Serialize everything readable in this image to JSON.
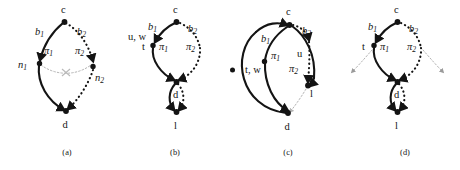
{
  "figure": {
    "background": "#ffffff",
    "ink": "#141414",
    "faint": "#b4b4b4",
    "width": 460,
    "height": 170
  },
  "panels": [
    {
      "id": "a",
      "caption": "(a)",
      "nodes": [
        {
          "name": "c",
          "label": "c"
        },
        {
          "name": "d",
          "label": "d"
        },
        {
          "name": "n1",
          "label": "n",
          "sub": "1"
        },
        {
          "name": "n2",
          "label": "n",
          "sub": "2"
        }
      ],
      "edges": [
        {
          "name": "b1",
          "label": "b",
          "sub": "1",
          "style": "solid"
        },
        {
          "name": "b2",
          "label": "b",
          "sub": "2",
          "style": "dotted"
        },
        {
          "name": "pi1",
          "label": "π",
          "sub": "1",
          "style": "solid"
        },
        {
          "name": "pi2",
          "label": "π",
          "sub": "2",
          "style": "dotted"
        },
        {
          "name": "cut",
          "label": "×",
          "style": "faint"
        }
      ]
    },
    {
      "id": "b",
      "caption": "(b)",
      "nodes": [
        {
          "name": "c",
          "label": "c"
        },
        {
          "name": "d",
          "label": "d"
        },
        {
          "name": "l",
          "label": "l"
        }
      ],
      "edges": [
        {
          "name": "b1",
          "label": "b",
          "sub": "1",
          "style": "solid"
        },
        {
          "name": "b2",
          "label": "b",
          "sub": "2",
          "style": "dotted"
        },
        {
          "name": "pi1",
          "label": "π",
          "sub": "1",
          "style": "solid"
        },
        {
          "name": "pi2",
          "label": "π",
          "sub": "2",
          "style": "dotted"
        }
      ],
      "annotations": [
        {
          "name": "uw",
          "label": "u, w"
        },
        {
          "name": "t",
          "label": "t"
        }
      ]
    },
    {
      "id": "c",
      "caption": "(c)",
      "nodes": [
        {
          "name": "c",
          "label": "c"
        },
        {
          "name": "d",
          "label": "d"
        },
        {
          "name": "l",
          "label": "l"
        }
      ],
      "edges": [
        {
          "name": "b1",
          "label": "b",
          "sub": "1",
          "style": "solid"
        },
        {
          "name": "b2",
          "label": "b",
          "sub": "2",
          "style": "dotted"
        },
        {
          "name": "pi1",
          "label": "π",
          "sub": "1",
          "style": "solid"
        },
        {
          "name": "pi2",
          "label": "π",
          "sub": "2",
          "style": "dotted"
        }
      ],
      "annotations": [
        {
          "name": "tw",
          "label": "t, w"
        },
        {
          "name": "u",
          "label": "u"
        }
      ]
    },
    {
      "id": "d",
      "caption": "(d)",
      "nodes": [
        {
          "name": "c",
          "label": "c"
        },
        {
          "name": "d",
          "label": "d"
        },
        {
          "name": "l",
          "label": "l"
        }
      ],
      "edges": [
        {
          "name": "b1",
          "label": "b",
          "sub": "1",
          "style": "solid"
        },
        {
          "name": "b2",
          "label": "b",
          "sub": "2",
          "style": "dotted"
        },
        {
          "name": "pi1",
          "label": "π",
          "sub": "1",
          "style": "solid"
        },
        {
          "name": "pi2",
          "label": "π",
          "sub": "2",
          "style": "dotted"
        }
      ],
      "annotations": [
        {
          "name": "t",
          "label": "t"
        }
      ]
    }
  ]
}
